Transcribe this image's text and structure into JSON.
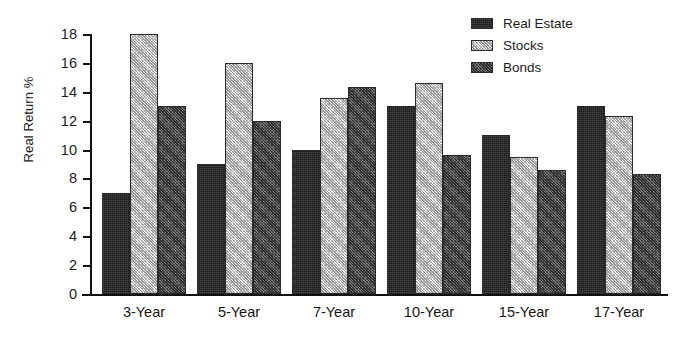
{
  "chart_data": {
    "type": "bar",
    "title": "",
    "xlabel": "",
    "ylabel": "Real Return %",
    "ylim": [
      0,
      18
    ],
    "ytick_step": 2,
    "yticks": [
      "18",
      "16",
      "14",
      "12",
      "10",
      "8",
      "6",
      "4",
      "2",
      "0"
    ],
    "grid": false,
    "legend_position": "top-right",
    "categories": [
      "3-Year",
      "5-Year",
      "7-Year",
      "10-Year",
      "15-Year",
      "17-Year"
    ],
    "series": [
      {
        "name": "Real Estate",
        "color": "#1b1b1b",
        "values": [
          7.0,
          9.0,
          10.0,
          13.0,
          11.0,
          13.0
        ]
      },
      {
        "name": "Stocks",
        "color": "#c8c8c8",
        "values": [
          18.0,
          16.0,
          13.6,
          14.6,
          9.5,
          12.3
        ]
      },
      {
        "name": "Bonds",
        "color": "#555555",
        "values": [
          13.0,
          12.0,
          14.3,
          9.6,
          8.6,
          8.3
        ]
      }
    ]
  },
  "legend": {
    "items": [
      {
        "label": "Real Estate"
      },
      {
        "label": "Stocks"
      },
      {
        "label": "Bonds"
      }
    ]
  }
}
